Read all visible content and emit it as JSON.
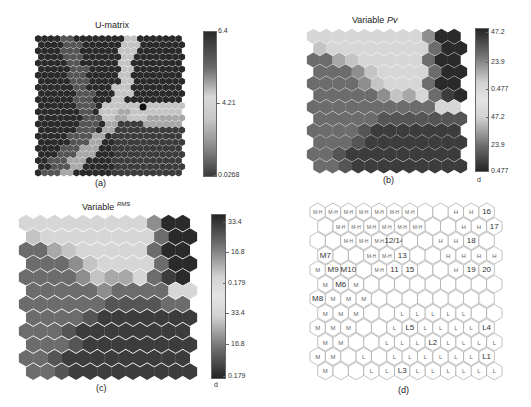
{
  "panels": {
    "a": {
      "title": "U-matrix",
      "caption": "(a)",
      "colorbar_ticks": [
        "6.4",
        "4.21",
        "0.0268"
      ]
    },
    "b": {
      "title_prefix": "Variable",
      "title_var": "Pv",
      "caption": "(b)",
      "colorbar_ticks": [
        "47.2",
        "23.9",
        "0.477",
        "47.2",
        "23.9",
        "0.477"
      ],
      "unit": "d"
    },
    "c": {
      "title_prefix": "Variable",
      "title_var": "RMS",
      "caption": "(c)",
      "colorbar_ticks": [
        "33.4",
        "16.8",
        "0.179",
        "33.4",
        "16.8",
        "0.179"
      ],
      "unit": "d"
    },
    "d": {
      "caption": "(d)"
    }
  },
  "chart_data": [
    {
      "type": "heatmap",
      "title": "U-matrix",
      "grid": "hexagonal",
      "colorbar": {
        "min": 0.0268,
        "mid": 4.21,
        "max": 6.4
      },
      "description": "Unified distance matrix; light ridges (high distance) form a Y-shaped cluster border from top-center down to lower-left and across to the right, with a dark outlier near center-right."
    },
    {
      "type": "heatmap",
      "title": "Variable Pv",
      "grid": "hexagonal 12x12",
      "colorbar": {
        "ticks": [
          47.2,
          23.9,
          0.477,
          47.2,
          23.9,
          0.477
        ],
        "unit": "d"
      },
      "shade_rows": [
        [
          8,
          8,
          8,
          8,
          8,
          8,
          8,
          8,
          8,
          5,
          1,
          1
        ],
        [
          7,
          8,
          8,
          8,
          8,
          8,
          8,
          8,
          8,
          4,
          1,
          1
        ],
        [
          4,
          4,
          6,
          7,
          8,
          8,
          8,
          8,
          8,
          4,
          1,
          1
        ],
        [
          4,
          4,
          4,
          5,
          7,
          8,
          8,
          8,
          8,
          4,
          1,
          1
        ],
        [
          4,
          4,
          4,
          4,
          5,
          7,
          8,
          8,
          8,
          4,
          1,
          1
        ],
        [
          4,
          4,
          4,
          4,
          4,
          5,
          7,
          6,
          8,
          4,
          2,
          1
        ],
        [
          4,
          4,
          4,
          4,
          4,
          4,
          4,
          4,
          4,
          4,
          8,
          8
        ],
        [
          4,
          4,
          4,
          4,
          4,
          3,
          3,
          3,
          3,
          3,
          3,
          3
        ],
        [
          4,
          4,
          4,
          4,
          3,
          2,
          2,
          2,
          2,
          2,
          2,
          2
        ],
        [
          4,
          4,
          4,
          3,
          2,
          2,
          2,
          2,
          2,
          2,
          2,
          2
        ],
        [
          4,
          4,
          3,
          2,
          2,
          2,
          2,
          2,
          2,
          2,
          2,
          2
        ],
        [
          4,
          4,
          3,
          2,
          2,
          2,
          2,
          2,
          2,
          2,
          2,
          2
        ]
      ]
    },
    {
      "type": "heatmap",
      "title": "Variable RMS",
      "grid": "hexagonal 12x12",
      "colorbar": {
        "ticks": [
          33.4,
          16.8,
          0.179,
          33.4,
          16.8,
          0.179
        ],
        "unit": "d"
      },
      "shade_rows": [
        [
          8,
          8,
          8,
          8,
          8,
          8,
          8,
          8,
          8,
          5,
          1,
          1
        ],
        [
          7,
          8,
          8,
          8,
          8,
          8,
          8,
          8,
          8,
          4,
          1,
          1
        ],
        [
          4,
          4,
          6,
          7,
          8,
          8,
          8,
          8,
          8,
          4,
          1,
          1
        ],
        [
          4,
          4,
          4,
          5,
          7,
          8,
          8,
          8,
          8,
          4,
          1,
          1
        ],
        [
          4,
          4,
          4,
          4,
          5,
          7,
          6,
          6,
          8,
          4,
          2,
          1
        ],
        [
          4,
          4,
          4,
          4,
          4,
          5,
          4,
          4,
          4,
          4,
          8,
          8
        ],
        [
          4,
          4,
          4,
          4,
          4,
          4,
          3,
          3,
          3,
          3,
          4,
          4
        ],
        [
          4,
          4,
          4,
          4,
          3,
          2,
          2,
          2,
          2,
          2,
          2,
          2
        ],
        [
          4,
          4,
          4,
          3,
          2,
          2,
          2,
          2,
          2,
          2,
          2,
          2
        ],
        [
          4,
          4,
          4,
          3,
          2,
          2,
          2,
          2,
          2,
          2,
          2,
          2
        ],
        [
          4,
          4,
          3,
          2,
          2,
          2,
          2,
          2,
          2,
          2,
          2,
          2
        ],
        [
          4,
          4,
          3,
          2,
          2,
          2,
          2,
          2,
          2,
          2,
          2,
          2
        ]
      ]
    },
    {
      "type": "table",
      "title": "Labeled SOM hit map",
      "grid": "hexagonal 12x12",
      "label_rows": [
        [
          "M-H",
          "M-H",
          "M-H",
          "M-H",
          "M-H",
          "M-H",
          "M-H",
          "",
          "",
          "H",
          "H",
          "16"
        ],
        [
          "",
          "M-H",
          "M-H",
          "M-H",
          "M-H",
          "M-H",
          "M-H",
          "",
          "",
          "H",
          "H",
          "17"
        ],
        [
          "",
          "",
          "M-H",
          "M-H",
          "M-H",
          "12/14",
          "",
          "",
          "H",
          "H",
          "18",
          ""
        ],
        [
          "M7",
          "",
          "",
          "M-H",
          "M-H",
          "13",
          "",
          "",
          "H",
          "H",
          "H",
          "H"
        ],
        [
          "M",
          "M9",
          "M10",
          "",
          "M-H",
          "11",
          "15",
          "",
          "",
          "H",
          "19",
          "20"
        ],
        [
          "M",
          "M6",
          "M",
          "",
          "",
          "",
          "",
          "",
          "",
          "",
          "",
          ""
        ],
        [
          "M8",
          "M",
          "M",
          "M",
          "",
          "",
          "",
          "",
          "",
          "",
          "",
          ""
        ],
        [
          "M",
          "M",
          "M",
          "",
          "",
          "L",
          "L",
          "L",
          "L",
          "L",
          "",
          ""
        ],
        [
          "M",
          "M",
          "M",
          "",
          "",
          "L",
          "L5",
          "L",
          "L",
          "L",
          "L",
          "L4"
        ],
        [
          "M",
          "M",
          "",
          "",
          "L",
          "L",
          "L",
          "L2",
          "L",
          "L",
          "L",
          "L"
        ],
        [
          "M",
          "M",
          "",
          "L",
          "",
          "L",
          "L",
          "L",
          "L",
          "L",
          "L",
          "L1"
        ],
        [
          "M",
          "",
          "",
          "L",
          "L",
          "L3",
          "L",
          "L",
          "L",
          "L",
          "L",
          "L"
        ]
      ]
    }
  ]
}
